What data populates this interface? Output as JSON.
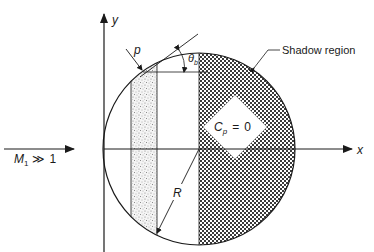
{
  "diagram": {
    "type": "schematic",
    "axes": {
      "y_label": "y",
      "x_label": "x"
    },
    "freestream": {
      "symbol": "M",
      "subscript": "1",
      "relation": "≫",
      "value": "1"
    },
    "labels": {
      "point": "p",
      "angle_symbol": "θ",
      "angle_subscript": "b",
      "radius": "R",
      "shadow": "Shadow region",
      "cp_symbol": "C",
      "cp_subscript": "p",
      "cp_equals": "=",
      "cp_value": "0"
    },
    "colors": {
      "line": "#1a1a1a",
      "hatch_dark": "#3a3a3a",
      "stipple": "#6a6a6a",
      "background": "#ffffff"
    }
  }
}
